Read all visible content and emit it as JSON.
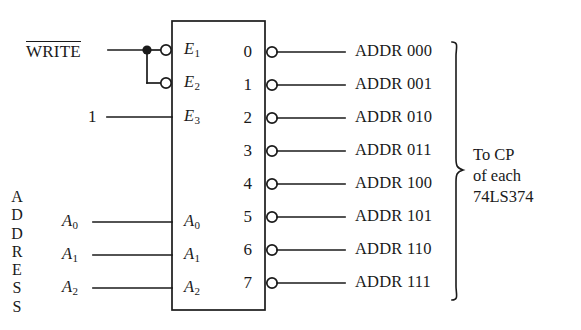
{
  "diagram": {
    "device_box": {
      "x": 172,
      "y": 21,
      "width": 93,
      "height": 289
    },
    "stroke_color": "#1a1a1a",
    "background": "#ffffff",
    "inputs": {
      "enable_signal": {
        "label": "WRITE",
        "overbar": true,
        "y": 50
      },
      "constant_signal": {
        "label": "1",
        "y": 117
      },
      "bus_label_vertical": [
        "A",
        "D",
        "D",
        "R",
        "E",
        "S",
        "S"
      ],
      "address_lines": [
        {
          "label": "A",
          "subscript": "0",
          "y": 222
        },
        {
          "label": "A",
          "subscript": "1",
          "y": 255
        },
        {
          "label": "A",
          "subscript": "2",
          "y": 288
        }
      ]
    },
    "pins_left": [
      {
        "label": "E",
        "subscript": "1",
        "y": 50,
        "bubble": true
      },
      {
        "label": "E",
        "subscript": "2",
        "y": 83,
        "bubble": true
      },
      {
        "label": "E",
        "subscript": "3",
        "y": 117,
        "bubble": false
      },
      {
        "label": "A",
        "subscript": "0",
        "y": 222,
        "bubble": false
      },
      {
        "label": "A",
        "subscript": "1",
        "y": 255,
        "bubble": false
      },
      {
        "label": "A",
        "subscript": "2",
        "y": 288,
        "bubble": false
      }
    ],
    "pins_right": [
      {
        "number": "0",
        "y": 52,
        "output": "ADDR 000"
      },
      {
        "number": "1",
        "y": 85,
        "output": "ADDR 001"
      },
      {
        "number": "2",
        "y": 118,
        "output": "ADDR 010"
      },
      {
        "number": "3",
        "y": 151,
        "output": "ADDR 011"
      },
      {
        "number": "4",
        "y": 184,
        "output": "ADDR 100"
      },
      {
        "number": "5",
        "y": 217,
        "output": "ADDR 101"
      },
      {
        "number": "6",
        "y": 250,
        "output": "ADDR 110"
      },
      {
        "number": "7",
        "y": 283,
        "output": "ADDR 111"
      }
    ],
    "annotation": {
      "line1": "To CP",
      "line2": "of each",
      "line3": "74LS374",
      "brace_top": 42,
      "brace_bottom": 300
    }
  }
}
